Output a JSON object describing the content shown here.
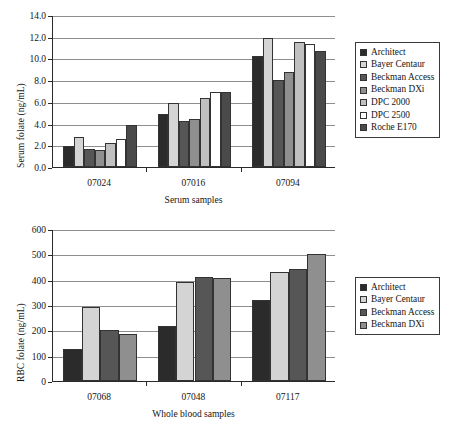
{
  "figure": {
    "background": "#ffffff",
    "panel_count": 2
  },
  "colors": {
    "architect": "#2b2b2b",
    "bayer_centaur": "#d4d4d4",
    "beckman_access": "#565656",
    "beckman_dxi": "#8f8f8f",
    "dpc_2000": "#c0c0c0",
    "dpc_2500": "#ffffff",
    "roche_e170": "#4a4a4a",
    "axis": "#2a2a2a",
    "grid": "#8e8e8e",
    "bar_outline": "#333333",
    "legend_border": "#3a3a3a"
  },
  "chart_data": [
    {
      "id": "serum-folate-chart",
      "type": "bar",
      "title": "",
      "xlabel": "Serum samples",
      "ylabel": "Serum folate (ng/mL)",
      "categories": [
        "07024",
        "07016",
        "07094"
      ],
      "ylim": [
        0.0,
        14.0
      ],
      "yticks": [
        "0.0",
        "2.0",
        "4.0",
        "6.0",
        "8.0",
        "10.0",
        "12.0",
        "14.0"
      ],
      "ytick_values": [
        0,
        2,
        4,
        6,
        8,
        10,
        12,
        14
      ],
      "grid": true,
      "legend_position": "right",
      "series": [
        {
          "name": "Architect",
          "color": "#2b2b2b",
          "values": [
            1.95,
            4.85,
            10.25
          ]
        },
        {
          "name": "Bayer Centaur",
          "color": "#d4d4d4",
          "values": [
            2.75,
            5.9,
            11.9
          ]
        },
        {
          "name": "Beckman Access",
          "color": "#565656",
          "values": [
            1.65,
            4.2,
            8.05
          ]
        },
        {
          "name": "Beckman DXi",
          "color": "#8f8f8f",
          "values": [
            1.55,
            4.45,
            8.75
          ]
        },
        {
          "name": "DPC 2000",
          "color": "#c0c0c0",
          "values": [
            2.25,
            6.35,
            11.55
          ]
        },
        {
          "name": "DPC 2500",
          "color": "#ffffff",
          "values": [
            2.55,
            6.95,
            11.35
          ]
        },
        {
          "name": "Roche E170",
          "color": "#4a4a4a",
          "values": [
            3.9,
            6.9,
            10.7
          ]
        }
      ]
    },
    {
      "id": "rbc-folate-chart",
      "type": "bar",
      "title": "",
      "xlabel": "Whole blood samples",
      "ylabel": "RBC folate (ng/mL)",
      "categories": [
        "07068",
        "07048",
        "07117"
      ],
      "ylim": [
        0,
        600
      ],
      "yticks": [
        "0",
        "100",
        "200",
        "300",
        "400",
        "500",
        "600"
      ],
      "ytick_values": [
        0,
        100,
        200,
        300,
        400,
        500,
        600
      ],
      "grid": true,
      "legend_position": "right",
      "series": [
        {
          "name": "Architect",
          "color": "#2b2b2b",
          "values": [
            125,
            216,
            319
          ]
        },
        {
          "name": "Bayer Centaur",
          "color": "#d4d4d4",
          "values": [
            293,
            390,
            432
          ]
        },
        {
          "name": "Beckman Access",
          "color": "#565656",
          "values": [
            200,
            410,
            443
          ]
        },
        {
          "name": "Beckman DXi",
          "color": "#8f8f8f",
          "values": [
            187,
            408,
            502
          ]
        }
      ]
    }
  ]
}
